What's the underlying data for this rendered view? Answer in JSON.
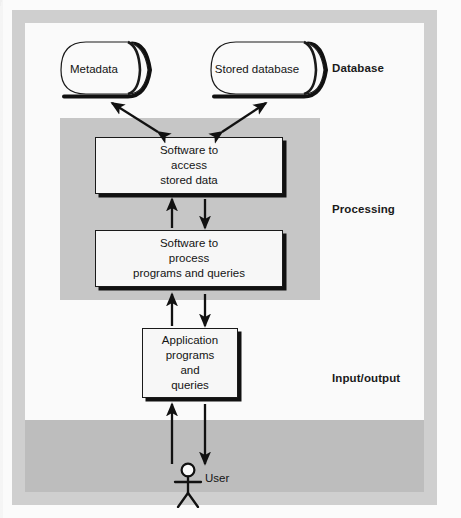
{
  "diagram": {
    "zones": [
      {
        "id": "database",
        "label": "Database"
      },
      {
        "id": "processing",
        "label": "Processing"
      },
      {
        "id": "io",
        "label": "Input/output"
      }
    ],
    "stores": [
      {
        "id": "metadata",
        "label": "Metadata",
        "shape": "cylinder-icon"
      },
      {
        "id": "stored-database",
        "label": "Stored\ndatabase",
        "shape": "cylinder-icon"
      }
    ],
    "processes": [
      {
        "id": "access-software",
        "label": "Software to\naccess\nstored data"
      },
      {
        "id": "process-software",
        "label": "Software to\nprocess\nprograms and queries"
      },
      {
        "id": "application",
        "label": "Application\nprograms\nand\nqueries"
      }
    ],
    "actor": {
      "id": "user",
      "label": "User",
      "shape": "stick-figure-icon"
    },
    "flows": [
      {
        "from": "access-software",
        "to": "metadata",
        "type": "double-arrow"
      },
      {
        "from": "access-software",
        "to": "stored-database",
        "type": "double-arrow"
      },
      {
        "from": "process-software",
        "to": "access-software",
        "type": "arrow-up"
      },
      {
        "from": "access-software",
        "to": "process-software",
        "type": "arrow-down"
      },
      {
        "from": "application",
        "to": "process-software",
        "type": "arrow-up"
      },
      {
        "from": "process-software",
        "to": "application",
        "type": "arrow-down"
      },
      {
        "from": "user",
        "to": "application",
        "type": "arrow-up"
      },
      {
        "from": "application",
        "to": "user",
        "type": "arrow-down"
      }
    ],
    "colors": {
      "frame_gray": "#cfcfcf",
      "processing_gray": "#c6c6c6",
      "io_gray": "#bdbdbd",
      "box_fill": "#f7f7f7",
      "stroke": "#1a1a1a",
      "page": "#fafafa"
    }
  }
}
